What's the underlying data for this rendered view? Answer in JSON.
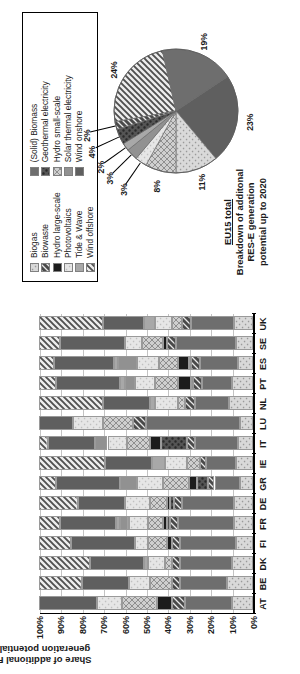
{
  "bar_chart": {
    "y_axis_title": "Share of additional RES-E generation potential 2020",
    "y_ticks": [
      "100%",
      "90%",
      "80%",
      "70%",
      "60%",
      "50%",
      "40%",
      "30%",
      "20%",
      "10%",
      "0%"
    ],
    "countries": [
      "AT",
      "BE",
      "DK",
      "FI",
      "FR",
      "DE",
      "GR",
      "IE",
      "IT",
      "LU",
      "NL",
      "PT",
      "ES",
      "SE",
      "UK"
    ]
  },
  "legend": {
    "col1": [
      {
        "label": "Biogas",
        "pattern": "light-solid"
      },
      {
        "label": "Biowaste",
        "pattern": "dark-hatch"
      },
      {
        "label": "Hydro large-scale",
        "pattern": "black"
      },
      {
        "label": "Photovoltaics",
        "pattern": "pale-dot"
      },
      {
        "label": "Tide & Wave",
        "pattern": "mid-grey"
      },
      {
        "label": "Wind offshore",
        "pattern": "diag-hatch"
      }
    ],
    "col2": [
      {
        "label": "(Solid) Biomass",
        "pattern": "dark-grey"
      },
      {
        "label": "Geothermal electricity",
        "pattern": "darker-grey"
      },
      {
        "label": "Hydro small-scale",
        "pattern": "grey-cross"
      },
      {
        "label": "Solar thermal electricity",
        "pattern": "h-lines"
      },
      {
        "label": "Wind onshore",
        "pattern": "med-dark"
      }
    ]
  },
  "pie_title": {
    "line1": "EU15 total",
    "line2": "Breakdown of",
    "line3": "additonal RES-E",
    "line4": "generation potential",
    "line5": "up to 2020"
  },
  "chart_data": [
    {
      "type": "bar",
      "subtype": "stacked-horizontal-100pct",
      "title": "",
      "xlabel": "",
      "ylabel": "Share of additional RES-E generation potential 2020",
      "ylim": [
        0,
        100
      ],
      "grid": true,
      "legend_position": "top-right-box",
      "categories": [
        "AT",
        "BE",
        "DK",
        "FI",
        "FR",
        "DE",
        "GR",
        "IE",
        "IT",
        "LU",
        "NL",
        "PT",
        "ES",
        "SE",
        "UK"
      ],
      "tick_labels": [
        "0%",
        "10%",
        "20%",
        "30%",
        "40%",
        "50%",
        "60%",
        "70%",
        "80%",
        "90%",
        "100%"
      ],
      "series": [
        {
          "name": "Biogas",
          "values": [
            10,
            12,
            10,
            8,
            9,
            9,
            6,
            8,
            7,
            6,
            11,
            10,
            7,
            8,
            9
          ]
        },
        {
          "name": "(Solid) Biomass",
          "values": [
            22,
            22,
            24,
            26,
            26,
            24,
            12,
            14,
            20,
            44,
            16,
            14,
            18,
            28,
            20
          ]
        },
        {
          "name": "Biowaste",
          "values": [
            6,
            4,
            4,
            4,
            4,
            4,
            3,
            3,
            4,
            6,
            5,
            4,
            4,
            4,
            4
          ]
        },
        {
          "name": "Geothermal electricity",
          "values": [
            0,
            0,
            0,
            0,
            1,
            2,
            5,
            0,
            12,
            0,
            0,
            1,
            1,
            0,
            0
          ]
        },
        {
          "name": "Hydro large-scale",
          "values": [
            7,
            0,
            0,
            2,
            2,
            1,
            4,
            0,
            5,
            0,
            0,
            6,
            5,
            2,
            0
          ]
        },
        {
          "name": "Hydro small-scale",
          "values": [
            16,
            10,
            3,
            9,
            7,
            8,
            12,
            6,
            11,
            14,
            3,
            11,
            9,
            10,
            5
          ]
        },
        {
          "name": "Photovoltaics",
          "values": [
            12,
            10,
            8,
            6,
            9,
            12,
            12,
            10,
            9,
            14,
            11,
            9,
            10,
            8,
            8
          ]
        },
        {
          "name": "Solar thermal electricity",
          "values": [
            0,
            0,
            0,
            0,
            4,
            0,
            8,
            0,
            6,
            0,
            0,
            5,
            9,
            0,
            0
          ]
        },
        {
          "name": "Tide & Wave",
          "values": [
            0,
            0,
            2,
            0,
            2,
            0,
            0,
            6,
            0,
            0,
            2,
            2,
            2,
            0,
            5
          ]
        },
        {
          "name": "Wind onshore",
          "values": [
            27,
            22,
            25,
            30,
            26,
            22,
            30,
            22,
            22,
            16,
            22,
            30,
            28,
            30,
            19
          ]
        },
        {
          "name": "Wind offshore",
          "values": [
            0,
            20,
            24,
            15,
            10,
            18,
            8,
            31,
            4,
            0,
            30,
            8,
            7,
            10,
            30
          ]
        }
      ]
    },
    {
      "type": "pie",
      "title": "EU15 total — Breakdown of additonal RES-E generation potential up to 2020",
      "labels": [
        "Wind offshore",
        "(Solid) Biomass",
        "Wind onshore",
        "Biogas",
        "Hydro small-scale",
        "Photovoltaics",
        "Solar thermal electricity",
        "Tide & Wave",
        "Geothermal electricity",
        "Biowaste"
      ],
      "values": [
        24,
        19,
        23,
        11,
        8,
        3,
        3,
        2,
        4,
        2
      ],
      "data_labels": [
        "24%",
        "19%",
        "23%",
        "11%",
        "8%",
        "3%",
        "3%",
        "2%",
        "4%",
        "2%"
      ]
    }
  ]
}
